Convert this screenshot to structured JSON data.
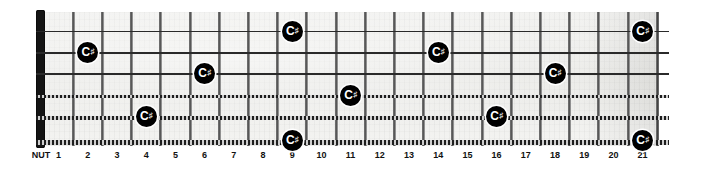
{
  "diagram": {
    "type": "guitar-fretboard",
    "instrument": "guitar",
    "string_count": 6,
    "fret_count": 21,
    "nut_label": "NUT",
    "note_label": "C",
    "accidental": "♯",
    "note_name": "C♯",
    "marker_color": "#000000",
    "marker_text_color": "#ffffff",
    "board_color": "#eeeeec",
    "nut_color": "#141414",
    "fret_color": "#4a4a4a"
  },
  "fret_numbers": [
    "1",
    "2",
    "3",
    "4",
    "5",
    "6",
    "7",
    "8",
    "9",
    "10",
    "11",
    "12",
    "13",
    "14",
    "15",
    "16",
    "17",
    "18",
    "19",
    "20",
    "21"
  ],
  "strings": [
    {
      "index": 1,
      "name": "e",
      "type": "plain"
    },
    {
      "index": 2,
      "name": "B",
      "type": "plain"
    },
    {
      "index": 3,
      "name": "G",
      "type": "plain"
    },
    {
      "index": 4,
      "name": "D",
      "type": "wound"
    },
    {
      "index": 5,
      "name": "A",
      "type": "wound"
    },
    {
      "index": 6,
      "name": "E",
      "type": "wound"
    }
  ],
  "notes": [
    {
      "string": 1,
      "fret": 9,
      "label": "C",
      "accidental": "♯"
    },
    {
      "string": 1,
      "fret": 21,
      "label": "C",
      "accidental": "♯"
    },
    {
      "string": 2,
      "fret": 2,
      "label": "C",
      "accidental": "♯"
    },
    {
      "string": 2,
      "fret": 14,
      "label": "C",
      "accidental": "♯"
    },
    {
      "string": 3,
      "fret": 6,
      "label": "C",
      "accidental": "♯"
    },
    {
      "string": 3,
      "fret": 18,
      "label": "C",
      "accidental": "♯"
    },
    {
      "string": 4,
      "fret": 11,
      "label": "C",
      "accidental": "♯"
    },
    {
      "string": 5,
      "fret": 4,
      "label": "C",
      "accidental": "♯"
    },
    {
      "string": 5,
      "fret": 16,
      "label": "C",
      "accidental": "♯"
    },
    {
      "string": 6,
      "fret": 9,
      "label": "C",
      "accidental": "♯"
    },
    {
      "string": 6,
      "fret": 21,
      "label": "C",
      "accidental": "♯"
    }
  ],
  "geometry": {
    "board_left": 44,
    "board_right": 658,
    "board_top": 12,
    "board_bottom": 146,
    "string_y": [
      31,
      52,
      73,
      95,
      116,
      140
    ],
    "fret_x": [
      44,
      73.2,
      102.4,
      131.6,
      160.8,
      190,
      219.2,
      248.4,
      277.6,
      306.8,
      336,
      365.2,
      394.4,
      423.6,
      452.8,
      482,
      511.2,
      540.4,
      569.6,
      598.8,
      628,
      657.2
    ]
  }
}
